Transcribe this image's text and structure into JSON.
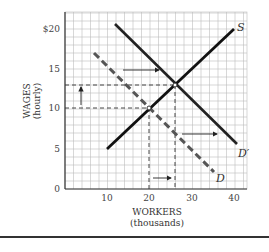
{
  "chart_data": {
    "type": "line",
    "title": "",
    "xlabel": "WORKERS",
    "xlabel_sub": "(thousands)",
    "ylabel": "WAGES",
    "ylabel_sub": "(hourly)",
    "xlim": [
      0,
      43
    ],
    "ylim": [
      0,
      22
    ],
    "x_ticks": [
      10,
      20,
      30,
      40
    ],
    "x_tick_labels": [
      "10",
      "20",
      "30",
      "40"
    ],
    "y_ticks": [
      0,
      5,
      10,
      15,
      20
    ],
    "y_tick_labels": [
      "0",
      "5",
      "10",
      "15",
      "$20"
    ],
    "grid": true,
    "series": [
      {
        "name": "S",
        "label": "S",
        "style": "solid",
        "points": [
          [
            10,
            5
          ],
          [
            40,
            20
          ]
        ]
      },
      {
        "name": "D'",
        "label": "D′",
        "style": "solid",
        "points": [
          [
            12,
            20.5
          ],
          [
            40,
            5.5
          ]
        ]
      },
      {
        "name": "D",
        "label": "D",
        "style": "dashed",
        "points": [
          [
            7,
            17
          ],
          [
            35,
            2
          ]
        ]
      }
    ],
    "equilibria": [
      {
        "name": "S∩D",
        "x": 20,
        "y": 10
      },
      {
        "name": "S∩D'",
        "x": 26,
        "y": 13
      }
    ],
    "guides": [
      {
        "type": "horizontal",
        "y": 13,
        "x_from": 0,
        "x_to": 26
      },
      {
        "type": "horizontal",
        "y": 10,
        "x_from": 0,
        "x_to": 20
      },
      {
        "type": "vertical",
        "x": 20,
        "y_from": 0,
        "y_to": 10
      },
      {
        "type": "vertical",
        "x": 26,
        "y_from": 0,
        "y_to": 13
      }
    ],
    "annotations": [
      {
        "type": "arrow",
        "direction": "up",
        "from": [
          3.8,
          10.3
        ],
        "to": [
          3.8,
          12.7
        ],
        "meaning": "wage rises 10 to 13"
      },
      {
        "type": "arrow",
        "direction": "right",
        "from": [
          13.5,
          15
        ],
        "to": [
          22.5,
          15
        ],
        "meaning": "demand shifts right"
      },
      {
        "type": "arrow",
        "direction": "right",
        "from": [
          27.5,
          7
        ],
        "to": [
          36,
          7
        ],
        "meaning": "demand shifts right"
      },
      {
        "type": "arrow",
        "direction": "right",
        "from": [
          20.7,
          1.4
        ],
        "to": [
          25,
          1.4
        ],
        "meaning": "employment rises 20 to 26"
      }
    ]
  },
  "labels": {
    "y_title": "WAGES",
    "y_sub": "(hourly)",
    "x_title": "WORKERS",
    "x_sub": "(thousands)",
    "s": "S",
    "dprime": "D′",
    "d": "D",
    "y0": "0",
    "y5": "5",
    "y10": "10",
    "y15": "15",
    "y20": "$20",
    "x10": "10",
    "x20": "20",
    "x30": "30",
    "x40": "40"
  }
}
